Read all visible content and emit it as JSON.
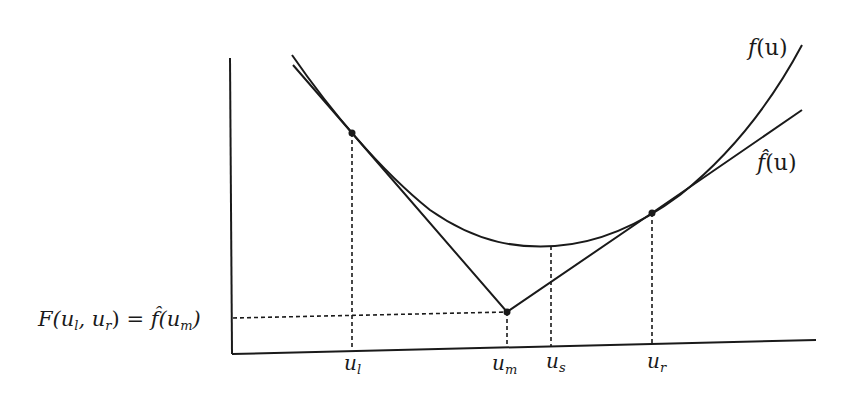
{
  "diagram": {
    "title": "",
    "colors": {
      "ink": "#1a1a1a",
      "background": "#ffffff"
    },
    "curves": {
      "f": {
        "label": "f(u)",
        "label_main": "f",
        "label_arg": "(u)"
      },
      "f_hat": {
        "label": "f̂(u)",
        "label_main": "f̂",
        "label_arg": "(u)"
      }
    },
    "x_ticks": [
      {
        "name": "u_l",
        "base": "u",
        "sub": "l"
      },
      {
        "name": "u_m",
        "base": "u",
        "sub": "m"
      },
      {
        "name": "u_s",
        "base": "u",
        "sub": "s"
      },
      {
        "name": "u_r",
        "base": "u",
        "sub": "r"
      }
    ],
    "y_label": {
      "text": "F(u_l, u_r) = f̂(u_m)",
      "part1": "F(u",
      "sub1": "l",
      "part2": ", u",
      "sub2": "r",
      "part3": ") = ",
      "fhat": "f̂",
      "part4": "(u",
      "sub3": "m",
      "part5": ")"
    },
    "points": [
      {
        "name": "u_l point",
        "on": "f and f_hat"
      },
      {
        "name": "u_m point",
        "on": "f_hat"
      },
      {
        "name": "u_r point",
        "on": "f and f_hat"
      }
    ]
  }
}
